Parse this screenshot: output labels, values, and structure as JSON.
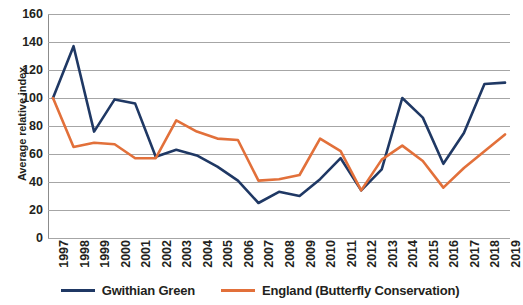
{
  "chart_data": {
    "type": "line",
    "title": "",
    "xlabel": "",
    "ylabel": "Average relative index",
    "ylim": [
      0,
      160
    ],
    "yticks": [
      0,
      20,
      40,
      60,
      80,
      100,
      120,
      140,
      160
    ],
    "grid": true,
    "legend_position": "bottom",
    "categories": [
      "1997",
      "1998",
      "1999",
      "2000",
      "2001",
      "2002",
      "2003",
      "2004",
      "2005",
      "2006",
      "2007",
      "2008",
      "2009",
      "2010",
      "2011",
      "2012",
      "2013",
      "2014",
      "2015",
      "2016",
      "2017",
      "2018",
      "2019"
    ],
    "series": [
      {
        "name": "Gwithian Green",
        "color": "#1F3864",
        "values": [
          100,
          137,
          76,
          99,
          96,
          58,
          63,
          59,
          51,
          41,
          25,
          33,
          30,
          42,
          57,
          34,
          49,
          100,
          86,
          53,
          75,
          110,
          111
        ]
      },
      {
        "name": "England (Butterfly Conservation)",
        "color": "#E2703A",
        "values": [
          100,
          65,
          68,
          67,
          57,
          57,
          84,
          76,
          71,
          70,
          41,
          42,
          45,
          71,
          62,
          34,
          56,
          66,
          55,
          36,
          50,
          62,
          74
        ]
      }
    ]
  },
  "axis": {
    "y_title": "Average relative index",
    "y_tick_labels": [
      "160",
      "140",
      "120",
      "100",
      "80",
      "60",
      "40",
      "20",
      "0"
    ],
    "x_tick_labels": [
      "1997",
      "1998",
      "1999",
      "2000",
      "2001",
      "2002",
      "2003",
      "2004",
      "2005",
      "2006",
      "2007",
      "2008",
      "2009",
      "2010",
      "2011",
      "2012",
      "2013",
      "2014",
      "2015",
      "2016",
      "2017",
      "2018",
      "2019"
    ]
  },
  "legend": {
    "items": [
      {
        "label": "Gwithian Green",
        "color": "#1F3864"
      },
      {
        "label": "England (Butterfly Conservation)",
        "color": "#E2703A"
      }
    ]
  },
  "colors": {
    "gwithian_green_line": "#1F3864",
    "england_line": "#E2703A",
    "gridline": "#A6A6A6",
    "text": "#231F20",
    "background": "#FFFFFF"
  }
}
